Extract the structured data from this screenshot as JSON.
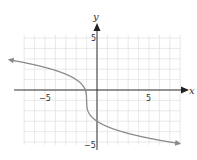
{
  "chart_data": {
    "type": "line",
    "title": "",
    "xlabel": "x",
    "ylabel": "y",
    "xlim": [
      -8.5,
      8
    ],
    "ylim": [
      -5.5,
      5.5
    ],
    "grid": true,
    "x_ticks_labeled": [
      -5,
      5
    ],
    "y_ticks_labeled": [
      5,
      -5
    ],
    "x_tick_labels": [
      "−5",
      "5"
    ],
    "y_tick_labels": [
      "5",
      "−5"
    ],
    "series": [
      {
        "name": "curve",
        "equation": "y = -2*cbrt(x+1) - 1",
        "x": [
          -8.5,
          -7,
          -5,
          -3,
          -2,
          -1.5,
          -1.1,
          -1,
          -0.9,
          -0.5,
          0,
          1,
          3,
          5,
          7,
          8
        ],
        "y": [
          2.91,
          2.82,
          2.63,
          2.17,
          1.0,
          0.59,
          -0.07,
          -1,
          -1.93,
          -2.59,
          -3,
          -3.52,
          -4.17,
          -4.63,
          -5,
          -5.16
        ],
        "arrows": "both ends",
        "color": "#888888"
      }
    ]
  },
  "labels": {
    "x_axis": "x",
    "y_axis": "y",
    "x_neg5": "−5",
    "x_pos5": "5",
    "y_pos5": "5",
    "y_neg5": "−5"
  },
  "colors": {
    "grid": "#e3e3e3",
    "axis": "#333333",
    "curve": "#8a8a8a"
  }
}
